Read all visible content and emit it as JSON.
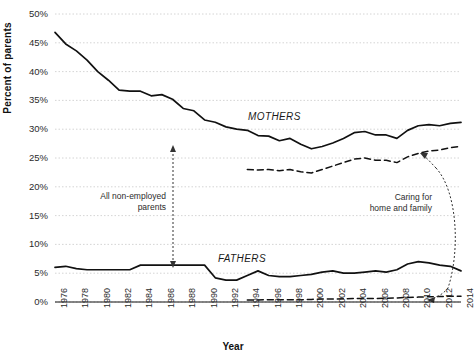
{
  "chart_data": {
    "type": "line",
    "title": "",
    "xlabel": "Year",
    "ylabel": "Percent of parents",
    "ylim": [
      0,
      50
    ],
    "xlim": [
      1976,
      2014
    ],
    "y_tick_labels": [
      "0%",
      "5%",
      "10%",
      "15%",
      "20%",
      "25%",
      "30%",
      "35%",
      "40%",
      "45%",
      "50%"
    ],
    "y_tick_values": [
      0,
      5,
      10,
      15,
      20,
      25,
      30,
      35,
      40,
      45,
      50
    ],
    "x_tick_labels": [
      "1976",
      "1978",
      "1980",
      "1982",
      "1984",
      "1986",
      "1988",
      "1990",
      "1992",
      "1994",
      "1996",
      "1998",
      "2000",
      "2002",
      "2004",
      "2006",
      "2008",
      "2010",
      "2012",
      "2014"
    ],
    "x_tick_values": [
      1976,
      1978,
      1980,
      1982,
      1984,
      1986,
      1988,
      1990,
      1992,
      1994,
      1996,
      1998,
      2000,
      2002,
      2004,
      2006,
      2008,
      2010,
      2012,
      2014
    ],
    "grid": true,
    "grid_style": "dotted-horizontal",
    "legend": "inline-annotations",
    "series": [
      {
        "name": "Mothers — all non-employed parents",
        "style": "solid",
        "color": "#111111",
        "x": [
          1976,
          1977,
          1978,
          1979,
          1980,
          1981,
          1982,
          1983,
          1984,
          1985,
          1986,
          1987,
          1988,
          1989,
          1990,
          1991,
          1992,
          1993,
          1994,
          1995,
          1996,
          1997,
          1998,
          1999,
          2000,
          2001,
          2002,
          2003,
          2004,
          2005,
          2006,
          2007,
          2008,
          2009,
          2010,
          2011,
          2012,
          2013,
          2014
        ],
        "values": [
          46.8,
          44.8,
          43.6,
          42.0,
          40.0,
          38.5,
          36.8,
          36.6,
          36.6,
          35.8,
          36.0,
          35.2,
          33.6,
          33.2,
          31.6,
          31.2,
          30.4,
          30.0,
          29.8,
          28.9,
          28.8,
          28.0,
          28.4,
          27.4,
          26.6,
          27.0,
          27.6,
          28.4,
          29.4,
          29.6,
          29.0,
          29.0,
          28.4,
          29.8,
          30.6,
          30.8,
          30.6,
          31.0,
          31.2
        ]
      },
      {
        "name": "Mothers — caring for home and family",
        "style": "dashed",
        "color": "#111111",
        "x": [
          1994,
          1995,
          1996,
          1997,
          1998,
          1999,
          2000,
          2001,
          2002,
          2003,
          2004,
          2005,
          2006,
          2007,
          2008,
          2009,
          2010,
          2011,
          2012,
          2013,
          2014
        ],
        "values": [
          23.0,
          22.9,
          23.0,
          22.8,
          23.0,
          22.6,
          22.4,
          23.0,
          23.6,
          24.2,
          24.8,
          25.0,
          24.6,
          24.6,
          24.2,
          25.2,
          25.8,
          26.2,
          26.4,
          26.8,
          27.0
        ]
      },
      {
        "name": "Fathers — all non-employed parents",
        "style": "solid",
        "color": "#111111",
        "x": [
          1976,
          1977,
          1978,
          1979,
          1980,
          1981,
          1982,
          1983,
          1984,
          1985,
          1986,
          1987,
          1988,
          1989,
          1990,
          1991,
          1992,
          1993,
          1994,
          1995,
          1996,
          1997,
          1998,
          1999,
          2000,
          2001,
          2002,
          2003,
          2004,
          2005,
          2006,
          2007,
          2008,
          2009,
          2010,
          2011,
          2012,
          2013,
          2014
        ],
        "values": [
          6.0,
          6.2,
          5.8,
          5.6,
          5.6,
          5.6,
          5.6,
          5.6,
          6.4,
          6.4,
          6.4,
          6.4,
          6.4,
          6.4,
          6.4,
          4.2,
          3.8,
          3.8,
          4.6,
          5.4,
          4.6,
          4.4,
          4.4,
          4.6,
          4.8,
          5.2,
          5.4,
          5.0,
          5.0,
          5.2,
          5.4,
          5.2,
          5.6,
          6.6,
          7.0,
          6.8,
          6.4,
          6.2,
          5.4
        ]
      },
      {
        "name": "Fathers — caring for home and family",
        "style": "dashed",
        "color": "#111111",
        "x": [
          1994,
          1995,
          1996,
          1997,
          1998,
          1999,
          2000,
          2001,
          2002,
          2003,
          2004,
          2005,
          2006,
          2007,
          2008,
          2009,
          2010,
          2011,
          2012,
          2013,
          2014
        ],
        "values": [
          0.35,
          0.35,
          0.4,
          0.4,
          0.4,
          0.4,
          0.45,
          0.5,
          0.5,
          0.55,
          0.6,
          0.6,
          0.6,
          0.65,
          0.7,
          0.8,
          0.85,
          0.9,
          0.95,
          1.0,
          1.0
        ]
      }
    ],
    "annotations": [
      {
        "name": "mothers-label",
        "text": "MOTHERS"
      },
      {
        "name": "fathers-label",
        "text": "FATHERS"
      },
      {
        "name": "all-non-employed-label",
        "text": "All non-employed\nparents"
      },
      {
        "name": "caring-for-home-label",
        "text": "Caring for\nhome and family"
      }
    ]
  },
  "axes": {
    "y_title": "Percent of parents",
    "x_title": "Year"
  }
}
